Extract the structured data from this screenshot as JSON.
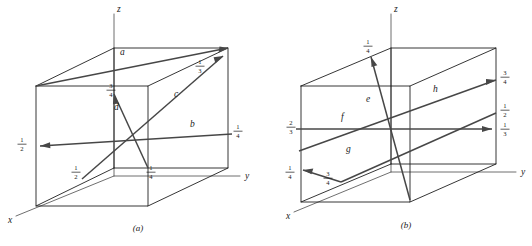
{
  "figure": {
    "panels": [
      {
        "id": "a",
        "caption": "(a)",
        "axes": [
          {
            "name": "z-axis",
            "label": "z"
          },
          {
            "name": "y-axis",
            "label": "y"
          },
          {
            "name": "x-axis",
            "label": "x"
          }
        ],
        "vectors": [
          {
            "name": "vector-a",
            "label": "a",
            "label_x": 120,
            "label_y": 55,
            "x1": 36,
            "y1": 86,
            "x2": 228,
            "y2": 48,
            "head_angle": -11.2
          },
          {
            "name": "vector-c",
            "label": "c",
            "label_x": 174,
            "label_y": 97,
            "x1": 82,
            "y1": 179,
            "x2": 223,
            "y2": 56,
            "head_angle": -41.1
          },
          {
            "name": "vector-b",
            "label": "b",
            "label_x": 190,
            "label_y": 127,
            "x1": 232,
            "y1": 134,
            "x2": 40,
            "y2": 146,
            "head_angle": 176.4
          },
          {
            "name": "vector-d",
            "label": "d",
            "label_x": 114,
            "label_y": 110,
            "x1": 148,
            "y1": 168,
            "x2": 114,
            "y2": 94,
            "head_angle": -114.7
          }
        ],
        "fractions": [
          {
            "name": "fraction-one-third-c-tip",
            "num": "1",
            "den": "3",
            "x": 200,
            "y": 66
          },
          {
            "name": "fraction-three-quarters-d-tip",
            "num": "3",
            "den": "4",
            "x": 111,
            "y": 90
          },
          {
            "name": "fraction-one-quarter-b-tail",
            "num": "1",
            "den": "4",
            "x": 238,
            "y": 131
          },
          {
            "name": "fraction-one-half-b-tip",
            "num": "1",
            "den": "2",
            "x": 22,
            "y": 144
          },
          {
            "name": "fraction-one-half-ac-tail",
            "num": "1",
            "den": "2",
            "x": 76,
            "y": 172
          },
          {
            "name": "fraction-one-quarter-d-tail",
            "num": "1",
            "den": "4",
            "x": 151,
            "y": 172
          }
        ]
      },
      {
        "id": "b",
        "caption": "(b)",
        "axes": [
          {
            "name": "z-axis",
            "label": "z"
          },
          {
            "name": "y-axis",
            "label": "y"
          },
          {
            "name": "x-axis",
            "label": "x"
          }
        ],
        "vectors": [
          {
            "name": "vector-e",
            "label": "e",
            "label_x": 100,
            "label_y": 102,
            "x1": 144,
            "y1": 200,
            "x2": 105,
            "y2": 57,
            "head_angle": -105.3
          },
          {
            "name": "vector-f",
            "label": "f",
            "label_x": 75,
            "label_y": 120,
            "x1": 30,
            "y1": 129,
            "x2": 226,
            "y2": 129,
            "head_angle": 0
          },
          {
            "name": "vector-g",
            "label": "g",
            "label_x": 80,
            "label_y": 152,
            "x1": 75,
            "y1": 182,
            "x2": 37,
            "y2": 170,
            "head_angle": 162.5
          },
          {
            "name": "vector-h",
            "label": "h",
            "label_x": 167,
            "label_y": 92,
            "x1": 33,
            "y1": 151,
            "x2": 230,
            "y2": 80,
            "head_angle": -19.8
          }
        ],
        "fractions": [
          {
            "name": "fraction-one-quarter-e-tip",
            "num": "1",
            "den": "4",
            "x": 102,
            "y": 46
          },
          {
            "name": "fraction-three-quarters-h-tip",
            "num": "3",
            "den": "4",
            "x": 239,
            "y": 77
          },
          {
            "name": "fraction-one-half-right",
            "num": "1",
            "den": "2",
            "x": 239,
            "y": 110
          },
          {
            "name": "fraction-one-third-f-tip",
            "num": "1",
            "den": "3",
            "x": 239,
            "y": 129
          },
          {
            "name": "fraction-two-thirds-f-tail",
            "num": "2",
            "den": "3",
            "x": 25,
            "y": 127
          },
          {
            "name": "fraction-one-quarter-g-tip",
            "num": "1",
            "den": "4",
            "x": 24,
            "y": 172
          },
          {
            "name": "fraction-three-quarters-g-tail",
            "num": "3",
            "den": "4",
            "x": 62,
            "y": 178
          }
        ]
      }
    ],
    "colors": {
      "edge": "#1f1f1f",
      "axis": "#6f6f6f",
      "vector": "#474747",
      "text": "#1a1a1a",
      "background": "#ffffff"
    }
  }
}
